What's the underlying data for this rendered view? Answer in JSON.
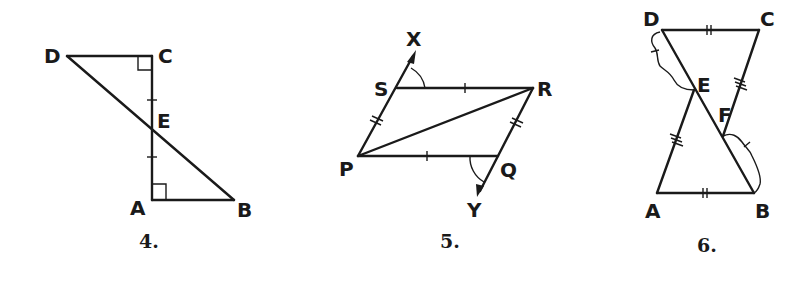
{
  "figures": [
    {
      "number": "4.",
      "labels": {
        "D": "D",
        "C": "C",
        "E": "E",
        "A": "A",
        "B": "B"
      },
      "description": "Segments DB and CA intersect at E; right angles at C and A; CE ≅ EA (single tick marks)"
    },
    {
      "number": "5.",
      "labels": {
        "X": "X",
        "S": "S",
        "R": "R",
        "P": "P",
        "Q": "Q",
        "Y": "Y"
      },
      "description": "Quadrilateral PQRS with diagonal PR; SR ≅ PQ (single ticks); PS ≅ QR (double ticks); rays PX and RY; marked angles XSR and PQY"
    },
    {
      "number": "6.",
      "labels": {
        "D": "D",
        "C": "C",
        "E": "E",
        "F": "F",
        "A": "A",
        "B": "B"
      },
      "description": "DC ≅ AB (double ticks); CF ≅ AE (triple ticks); braces DF ≅ EB (single ticks); segments DB, AE, CF"
    }
  ]
}
